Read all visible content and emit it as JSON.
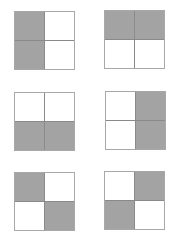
{
  "diagram": {
    "shade_color": "#a3a3a3",
    "border_color": "#a8a8a8",
    "squares": [
      {
        "position": "row1-left",
        "cells": [
          1,
          0,
          1,
          0
        ],
        "x": 14,
        "y": 11
      },
      {
        "position": "row1-right",
        "cells": [
          1,
          1,
          0,
          0
        ],
        "x": 104,
        "y": 10
      },
      {
        "position": "row2-left",
        "cells": [
          0,
          0,
          1,
          1
        ],
        "x": 14,
        "y": 92
      },
      {
        "position": "row2-right",
        "cells": [
          0,
          1,
          0,
          1
        ],
        "x": 105,
        "y": 91
      },
      {
        "position": "row3-left",
        "cells": [
          1,
          0,
          0,
          1
        ],
        "x": 14,
        "y": 172
      },
      {
        "position": "row3-right",
        "cells": [
          0,
          1,
          1,
          0
        ],
        "x": 104,
        "y": 171
      }
    ]
  }
}
